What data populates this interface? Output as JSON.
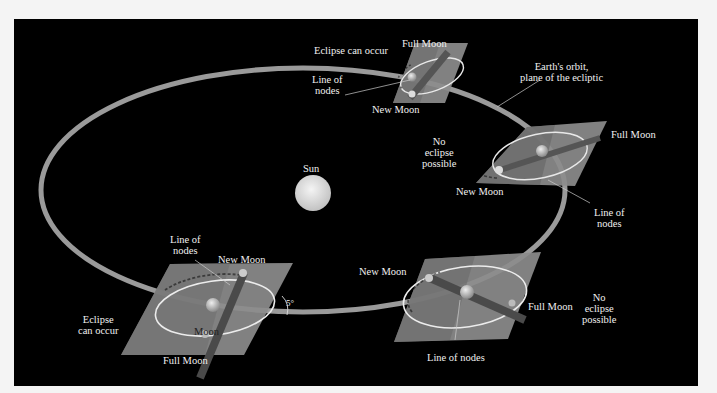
{
  "diagram": {
    "type": "lunar-eclipse-geometry",
    "background": "#000000",
    "orbit_color": "#9a9a9a",
    "plane_color": "#8a8a8a",
    "center": {
      "label": "Sun"
    },
    "labels": {
      "ecliptic": "Earth's orbit,\nplane of the ecliptic",
      "top_eclipse": "Eclipse can occur",
      "top_full": "Full Moon",
      "top_new": "New Moon",
      "top_nodes": "Line of\nnodes",
      "right_full": "Full Moon",
      "right_no_eclipse": "No\neclipse\npossible",
      "right_new": "New Moon",
      "right_nodes": "Line of\nnodes",
      "bl_nodes": "Line of\nnodes",
      "bl_new": "New Moon",
      "bl_eclipse": "Eclipse\ncan occur",
      "bl_moon": "Moon",
      "bl_full": "Full Moon",
      "angle": "5°",
      "br_new": "New Moon",
      "br_full": "Full Moon",
      "br_no_eclipse": "No\neclipse\npossible",
      "br_nodes": "Line of nodes"
    },
    "positions": [
      {
        "name": "top",
        "eclipse": true
      },
      {
        "name": "right",
        "eclipse": false
      },
      {
        "name": "bottom-left",
        "eclipse": true
      },
      {
        "name": "bottom-right",
        "eclipse": false
      }
    ]
  }
}
